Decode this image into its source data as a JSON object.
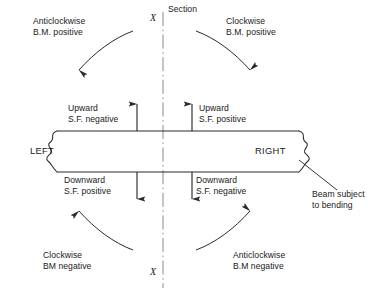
{
  "figure": {
    "line_color": "#2b2b2b",
    "text_color": "#1a1a1a",
    "background": "#ffffff"
  },
  "section_line": {
    "top_label": "Section",
    "top_mark": "X",
    "bottom_mark": "X",
    "style": "dash-dot"
  },
  "beam": {
    "left_label": "LEFT",
    "right_label": "RIGHT",
    "annotation": {
      "line1": "Beam subject",
      "line2": "to bending"
    }
  },
  "bending_moments": [
    {
      "position": "top-left",
      "line1": "Anticlockwise",
      "line2": "B.M. positive"
    },
    {
      "position": "top-right",
      "line1": "Clockwise",
      "line2": "B.M. positive"
    },
    {
      "position": "bottom-left",
      "line1": "Clockwise",
      "line2": "BM negative"
    },
    {
      "position": "bottom-right",
      "line1": "Anticlockwise",
      "line2": "B.M negative"
    }
  ],
  "shear_forces": [
    {
      "position": "top-left",
      "line1": "Upward",
      "line2": "S.F. negative",
      "direction": "up"
    },
    {
      "position": "top-right",
      "line1": "Upward",
      "line2": "S.F. positive",
      "direction": "up"
    },
    {
      "position": "bottom-left",
      "line1": "Downward",
      "line2": "S.F. positive",
      "direction": "down"
    },
    {
      "position": "bottom-right",
      "line1": "Downward",
      "line2": "S.F. negative",
      "direction": "down"
    }
  ]
}
